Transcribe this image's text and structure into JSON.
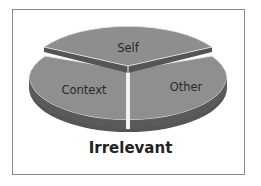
{
  "diagram": {
    "type": "3d-pie",
    "caption": "Irrelevant",
    "segments": [
      {
        "label": "Self",
        "position": "top",
        "exploded": true
      },
      {
        "label": "Context",
        "position": "bottom-left",
        "exploded": false
      },
      {
        "label": "Other",
        "position": "bottom-right",
        "exploded": false
      }
    ],
    "colors": {
      "top_face": "#8e8e8e",
      "side_face": "#555555",
      "separator": "#f2f2f2",
      "frame": "#8a8a8a"
    }
  }
}
